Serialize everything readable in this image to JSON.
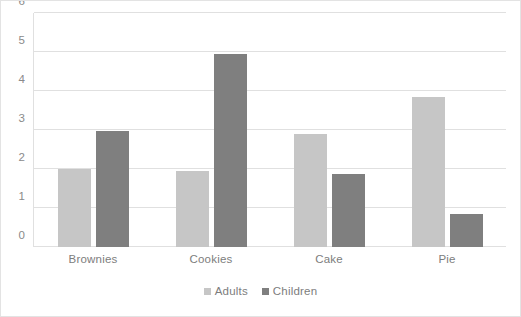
{
  "chart_data": {
    "type": "bar",
    "title": "",
    "xlabel": "",
    "ylabel": "",
    "categories": [
      "Brownies",
      "Cookies",
      "Cake",
      "Pie"
    ],
    "series": [
      {
        "name": "Adults",
        "color": "#c6c6c6",
        "values": [
          2.0,
          1.95,
          2.9,
          3.85
        ]
      },
      {
        "name": "Children",
        "color": "#7f7f7f",
        "values": [
          2.97,
          4.95,
          1.87,
          0.85
        ]
      }
    ],
    "ylim": [
      0,
      6
    ],
    "yticks": [
      0,
      1,
      2,
      3,
      4,
      5,
      6
    ],
    "ytick_labels": [
      "0",
      "1",
      "2",
      "3",
      "4",
      "5",
      "6"
    ],
    "grid": true,
    "legend_position": "bottom",
    "background_color": "#ffffff",
    "grid_color": "#e0e0e0",
    "tick_label_color": "#8a8a8a"
  }
}
